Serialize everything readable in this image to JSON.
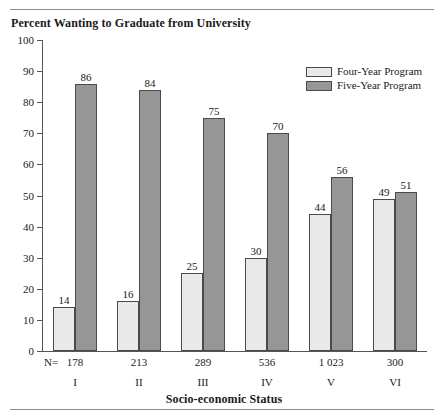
{
  "chart_data": {
    "type": "bar",
    "title": "Percent Wanting to Graduate from University",
    "xlabel": "Socio-economic Status",
    "ylabel": "",
    "ylim": [
      0,
      100
    ],
    "yticks": [
      0,
      10,
      20,
      30,
      40,
      50,
      60,
      70,
      80,
      90,
      100
    ],
    "grid": false,
    "legend_position": "top-right",
    "categories": [
      "I",
      "II",
      "III",
      "IV",
      "V",
      "VI"
    ],
    "n_prefix": "N=",
    "n_counts": [
      "178",
      "213",
      "289",
      "536",
      "1 023",
      "300"
    ],
    "series": [
      {
        "name": "Four-Year Program",
        "color": "#e9e9e9",
        "values": [
          14,
          16,
          25,
          30,
          44,
          49
        ]
      },
      {
        "name": "Five-Year Program",
        "color": "#969696",
        "values": [
          86,
          84,
          75,
          70,
          56,
          51
        ]
      }
    ]
  }
}
